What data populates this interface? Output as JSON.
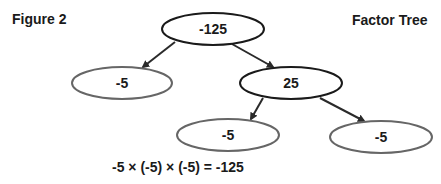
{
  "figure_label": "Figure 2",
  "title": "Factor Tree",
  "nodes": [
    {
      "id": "root",
      "value": "-125",
      "cx": 213,
      "cy": 29,
      "rx": 51,
      "ry": 16,
      "stroke": "#1a1a1a"
    },
    {
      "id": "left",
      "value": "-5",
      "cx": 122,
      "cy": 83,
      "rx": 50,
      "ry": 16,
      "stroke": "#666666"
    },
    {
      "id": "mid",
      "value": "25",
      "cx": 291,
      "cy": 83,
      "rx": 51,
      "ry": 16,
      "stroke": "#1a1a1a"
    },
    {
      "id": "bl",
      "value": "-5",
      "cx": 228,
      "cy": 135,
      "rx": 51,
      "ry": 16,
      "stroke": "#666666"
    },
    {
      "id": "br",
      "value": "-5",
      "cx": 381,
      "cy": 137,
      "rx": 51,
      "ry": 16,
      "stroke": "#666666"
    }
  ],
  "edges": [
    {
      "from": "root",
      "to": "left",
      "x1": 175,
      "y1": 42,
      "x2": 143,
      "y2": 67
    },
    {
      "from": "root",
      "to": "mid",
      "x1": 232,
      "y1": 44,
      "x2": 273,
      "y2": 67
    },
    {
      "from": "mid",
      "to": "bl",
      "x1": 263,
      "y1": 98,
      "x2": 251,
      "y2": 119
    },
    {
      "from": "mid",
      "to": "br",
      "x1": 320,
      "y1": 98,
      "x2": 364,
      "y2": 121
    }
  ],
  "equation": "-5 × (-5) × (-5) = -125"
}
